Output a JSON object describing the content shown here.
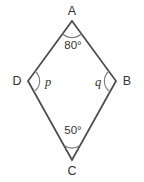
{
  "figure": {
    "type": "kite-quadrilateral-diagram",
    "background_color": "#ffffff",
    "stroke_color": "#4a4a4a",
    "arc_color": "#7a7a7a",
    "text_color": "#333333",
    "vertices": {
      "A": {
        "label": "A",
        "x": 72,
        "y": 21,
        "label_x": 72,
        "label_y": 15
      },
      "B": {
        "label": "B",
        "x": 116,
        "y": 81,
        "label_x": 127,
        "label_y": 85
      },
      "C": {
        "label": "C",
        "x": 72,
        "y": 160,
        "label_x": 72,
        "label_y": 175
      },
      "D": {
        "label": "D",
        "x": 28,
        "y": 81,
        "label_x": 17,
        "label_y": 85
      }
    },
    "angles": [
      {
        "at": "A",
        "label": "80°",
        "label_x": 73,
        "label_y": 49,
        "arc": "M 62.5,33.5 A 13,13 0 0 0 81.5,33.5"
      },
      {
        "at": "D",
        "label": "p",
        "label_x": 48,
        "label_y": 86,
        "arc": "M 35.5,71.5 A 13,13 0 0 1 35.5,90.5"
      },
      {
        "at": "B",
        "label": "q",
        "label_x": 98,
        "label_y": 86,
        "arc": "M 108.5,71.5 A 13,13 0 0 0 108.5,90.5"
      },
      {
        "at": "C",
        "label": "50°",
        "label_x": 73,
        "label_y": 134,
        "arc": "M 64.5,145.5 A 12,12 0 0 0 79.5,145.5"
      }
    ],
    "edges": [
      {
        "name": "edge-AB",
        "from": "A",
        "to": "B"
      },
      {
        "name": "edge-BC",
        "from": "B",
        "to": "C"
      },
      {
        "name": "edge-CD",
        "from": "C",
        "to": "D"
      },
      {
        "name": "edge-DA",
        "from": "D",
        "to": "A"
      }
    ],
    "outline_path": "M 72,21 L 116,81 L 72,160 L 28,81 Z"
  }
}
